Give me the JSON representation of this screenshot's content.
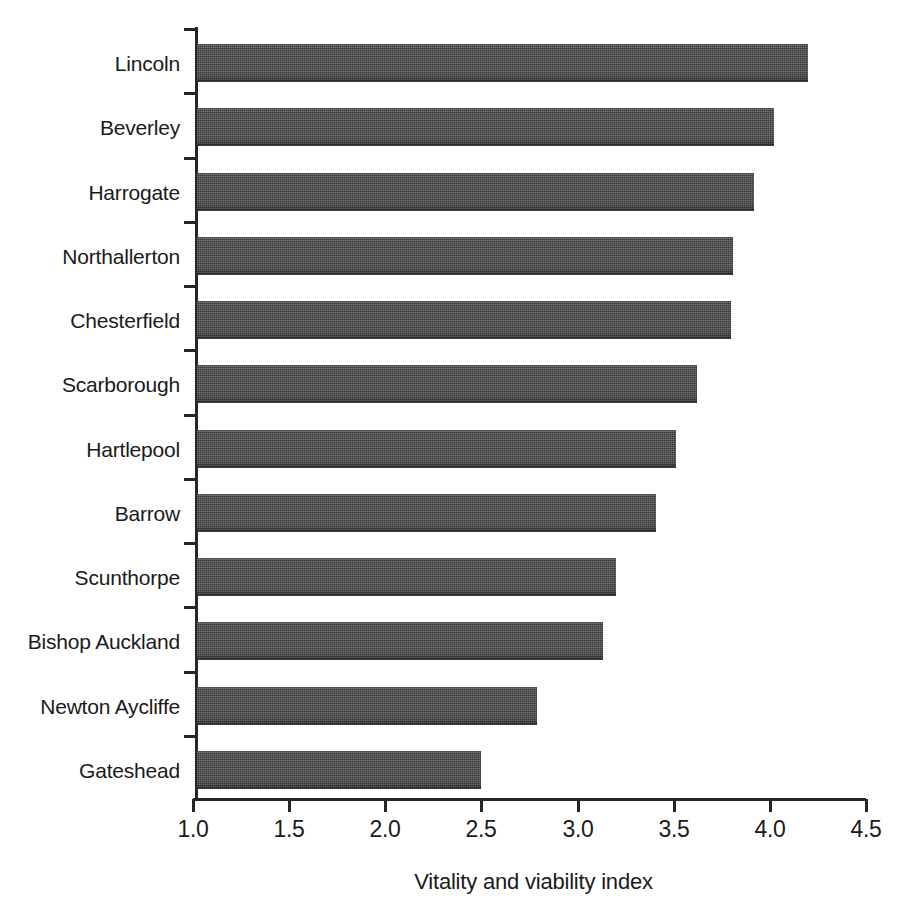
{
  "chart_data": {
    "type": "bar",
    "orientation": "horizontal",
    "title": "",
    "xlabel": "Vitality and viability index",
    "ylabel": "",
    "xlim": [
      1.0,
      4.5
    ],
    "xticks": [
      "1.0",
      "1.5",
      "2.0",
      "2.5",
      "3.0",
      "3.5",
      "4.0",
      "4.5"
    ],
    "xtick_values": [
      1.0,
      1.5,
      2.0,
      2.5,
      3.0,
      3.5,
      4.0,
      4.5
    ],
    "grid": false,
    "legend": "none",
    "bar_color": "#4b4b4b",
    "axis_color": "#262626",
    "background_color": "#ffffff",
    "categories": [
      "Lincoln",
      "Beverley",
      "Harrogate",
      "Northallerton",
      "Chesterfield",
      "Scarborough",
      "Hartlepool",
      "Barrow",
      "Scunthorpe",
      "Bishop Auckland",
      "Newton Aycliffe",
      "Gateshead"
    ],
    "values": [
      4.2,
      4.02,
      3.92,
      3.81,
      3.8,
      3.62,
      3.51,
      3.41,
      3.2,
      3.13,
      2.79,
      2.5
    ]
  }
}
